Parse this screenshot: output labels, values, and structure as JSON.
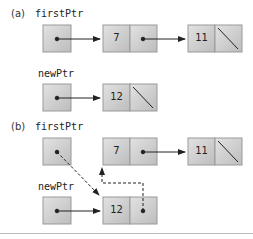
{
  "part_a": {
    "label": "(a)",
    "first_ptr": "firstPtr",
    "new_ptr": "newPtr",
    "nodes": [
      "7",
      "11"
    ],
    "new_node": "12"
  },
  "part_b": {
    "label": "(b)",
    "first_ptr": "firstPtr",
    "new_ptr": "newPtr",
    "nodes": [
      "7",
      "11"
    ],
    "new_node": "12"
  },
  "colors": {
    "box": "#cccccc",
    "box_shadow": "#999999",
    "line": "#222222"
  }
}
